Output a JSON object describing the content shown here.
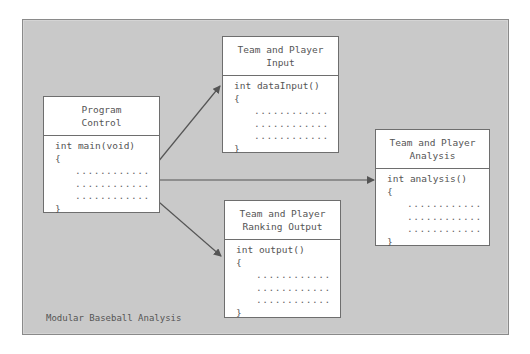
{
  "diagram": {
    "caption": "Modular Baseball Analysis",
    "colors": {
      "panel_bg": "#c9c9c9",
      "box_bg": "#ffffff",
      "line": "#555555",
      "text": "#555555"
    },
    "modules": [
      {
        "id": "program-control",
        "title_line1": "Program",
        "title_line2": "Control",
        "signature": "int main(void)",
        "open_brace": "{",
        "body_lines": [
          "............",
          "............",
          "............"
        ],
        "close_brace": "}"
      },
      {
        "id": "team-player-input",
        "title_line1": "Team and Player",
        "title_line2": "Input",
        "signature": "int dataInput()",
        "open_brace": "{",
        "body_lines": [
          "............",
          "............",
          "............"
        ],
        "close_brace": "}"
      },
      {
        "id": "team-player-analysis",
        "title_line1": "Team and Player",
        "title_line2": "Analysis",
        "signature": "int analysis()",
        "open_brace": "{",
        "body_lines": [
          "............",
          "............",
          "............"
        ],
        "close_brace": "}"
      },
      {
        "id": "team-player-ranking-output",
        "title_line1": "Team and Player",
        "title_line2": "Ranking Output",
        "signature": "int output()",
        "open_brace": "{",
        "body_lines": [
          "............",
          "............",
          "............"
        ],
        "close_brace": "}"
      }
    ],
    "connections": [
      {
        "from": "program-control",
        "to": "team-player-input"
      },
      {
        "from": "program-control",
        "to": "team-player-analysis"
      },
      {
        "from": "program-control",
        "to": "team-player-ranking-output"
      }
    ]
  }
}
